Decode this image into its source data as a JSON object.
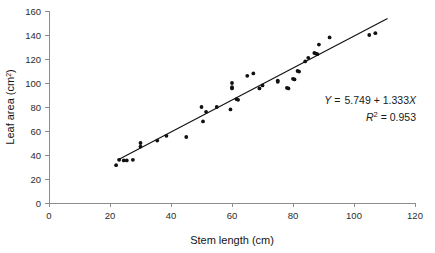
{
  "chart_data": {
    "type": "scatter",
    "title": "",
    "xlabel": "Stem length (cm)",
    "ylabel": "Leaf area (cm²)",
    "ylabel_base": "Leaf area (cm",
    "ylabel_sup": "2",
    "ylabel_close": ")",
    "xlim": [
      0,
      120
    ],
    "ylim": [
      0,
      160
    ],
    "xticks": [
      0,
      20,
      40,
      60,
      80,
      100,
      120
    ],
    "yticks": [
      0,
      20,
      40,
      60,
      80,
      100,
      120,
      140,
      160
    ],
    "xtick_labels": [
      "0",
      "20",
      "40",
      "60",
      "80",
      "100",
      "120"
    ],
    "ytick_labels": [
      "0",
      "20",
      "40",
      "60",
      "80",
      "100",
      "120",
      "140",
      "160"
    ],
    "grid": false,
    "legend": "none",
    "marker": "filled-circle",
    "marker_color": "#111111",
    "line_color": "#111111",
    "axis_color": "#8c8c8c",
    "annotations": {
      "equation_y": "Y",
      "equation_eq": "=",
      "equation_body": "5.749 + 1.333",
      "equation_x": "X",
      "equation_full": "Y =  5.749 + 1.333X",
      "r2_symbol": "R",
      "r2_sup": "2",
      "r2_value": "= 0.953",
      "r2_full": "R² = 0.953"
    },
    "fit": {
      "intercept": 5.749,
      "slope": 1.333,
      "r_squared": 0.953,
      "x_start": 22.5,
      "x_end": 111.0
    },
    "points": [
      [
        22.0,
        31.5
      ],
      [
        23.0,
        36.0
      ],
      [
        24.5,
        35.5
      ],
      [
        25.5,
        35.5
      ],
      [
        27.5,
        36.0
      ],
      [
        30.0,
        50.0
      ],
      [
        30.0,
        47.0
      ],
      [
        35.5,
        52.0
      ],
      [
        38.5,
        56.0
      ],
      [
        45.0,
        55.0
      ],
      [
        50.0,
        80.0
      ],
      [
        50.5,
        68.0
      ],
      [
        51.5,
        76.0
      ],
      [
        55.0,
        80.0
      ],
      [
        59.5,
        78.0
      ],
      [
        60.0,
        100.0
      ],
      [
        60.0,
        96.5
      ],
      [
        60.0,
        95.5
      ],
      [
        61.5,
        86.5
      ],
      [
        62.0,
        86.0
      ],
      [
        65.0,
        106.0
      ],
      [
        67.0,
        108.0
      ],
      [
        69.0,
        95.5
      ],
      [
        70.0,
        98.0
      ],
      [
        75.0,
        102.0
      ],
      [
        75.0,
        101.0
      ],
      [
        78.0,
        96.0
      ],
      [
        78.5,
        95.5
      ],
      [
        80.0,
        103.5
      ],
      [
        80.5,
        103.0
      ],
      [
        81.5,
        110.0
      ],
      [
        82.0,
        109.5
      ],
      [
        84.0,
        118.0
      ],
      [
        85.0,
        121.0
      ],
      [
        87.0,
        125.0
      ],
      [
        87.5,
        124.5
      ],
      [
        88.0,
        124.0
      ],
      [
        88.5,
        132.0
      ],
      [
        92.0,
        138.0
      ],
      [
        105.0,
        140.0
      ],
      [
        107.0,
        141.5
      ]
    ]
  },
  "caption": {
    "ghost_text": ""
  }
}
